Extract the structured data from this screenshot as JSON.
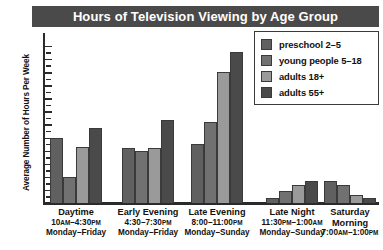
{
  "chart_data": {
    "type": "bar",
    "title": "Hours of Television Viewing by Age Group",
    "xlabel": "",
    "ylabel": "Average Number of Hours Per Week",
    "ylim": [
      0,
      12
    ],
    "ytick_labels": [
      "1",
      "2",
      "3",
      "4",
      "5",
      "6",
      "7",
      "8",
      "9",
      "10",
      "11",
      "12"
    ],
    "grid": false,
    "legend_position": "top-right",
    "categories": [
      "Daytime",
      "Early Evening",
      "Late Evening",
      "Late Night",
      "Saturday Morning"
    ],
    "series": [
      {
        "name": "preschool 2–5",
        "color": "#606060",
        "values": [
          5.0,
          4.2,
          4.5,
          0.4,
          1.7
        ]
      },
      {
        "name": "young people 5–18",
        "color": "#717171",
        "values": [
          2.0,
          4.0,
          6.2,
          0.9,
          1.4
        ]
      },
      {
        "name": "adults 18+",
        "color": "#9a9a9a",
        "values": [
          4.3,
          4.2,
          10.0,
          1.4,
          0.6
        ]
      },
      {
        "name": "adults 55+",
        "color": "#4a4a4a",
        "values": [
          5.7,
          6.3,
          11.5,
          1.7,
          0.35
        ]
      }
    ]
  },
  "legend": {
    "items": [
      {
        "label": "preschool 2–5",
        "color": "#606060"
      },
      {
        "label": "young people 5–18",
        "color": "#717171"
      },
      {
        "label": "adults 18+",
        "color": "#9a9a9a"
      },
      {
        "label": "adults 55+",
        "color": "#4a4a4a"
      }
    ]
  },
  "x_axis": {
    "categories": [
      {
        "name": "Daytime",
        "name2": "",
        "time_start": "10",
        "time_start_suffix": "AM",
        "time_mid": "–4:30",
        "time_end_suffix": "PM",
        "days": "Monday–Friday"
      },
      {
        "name": "Early Evening",
        "name2": "",
        "time_start": "4:30",
        "time_start_suffix": "",
        "time_mid": "–7:30",
        "time_end_suffix": "PM",
        "days": "Monday–Friday"
      },
      {
        "name": "Late Evening",
        "name2": "",
        "time_start": "8:00",
        "time_start_suffix": "",
        "time_mid": "–11:00",
        "time_end_suffix": "PM",
        "days": "Monday–Sunday"
      },
      {
        "name": "Late Night",
        "name2": "",
        "time_start": "11:30",
        "time_start_suffix": "PM",
        "time_mid": "–1:00",
        "time_end_suffix": "AM",
        "days": "Monday–Sunday"
      },
      {
        "name": "Saturday",
        "name2": "Morning",
        "time_start": "7:00",
        "time_start_suffix": "AM",
        "time_mid": "–1:00",
        "time_end_suffix": "PM",
        "days": ""
      }
    ]
  },
  "colors": {
    "title_bar": "#4a4a4a",
    "title_text": "#ffffff",
    "axis": "#2a2a2a"
  }
}
